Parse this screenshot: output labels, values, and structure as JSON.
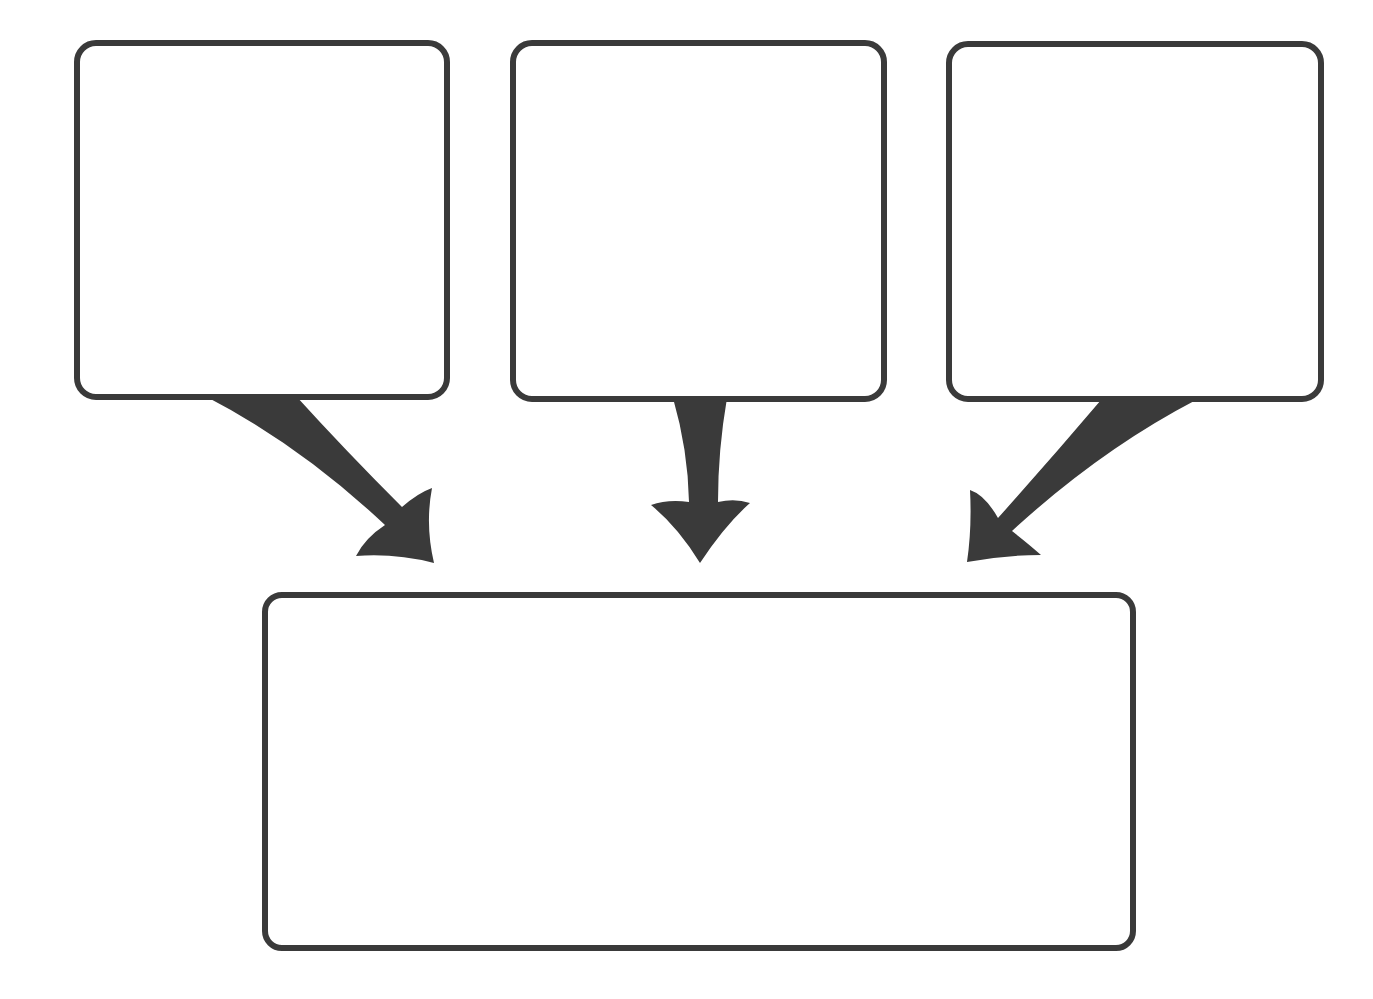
{
  "diagram": {
    "type": "flow-convergence",
    "stroke_color": "#3a3a3a",
    "background_color": "#ffffff",
    "boxes": {
      "left": {
        "label": ""
      },
      "middle": {
        "label": ""
      },
      "right": {
        "label": ""
      },
      "bottom": {
        "label": ""
      }
    },
    "arrows": [
      {
        "from": "left",
        "to": "bottom",
        "direction": "down-right"
      },
      {
        "from": "middle",
        "to": "bottom",
        "direction": "down"
      },
      {
        "from": "right",
        "to": "bottom",
        "direction": "down-left"
      }
    ]
  }
}
